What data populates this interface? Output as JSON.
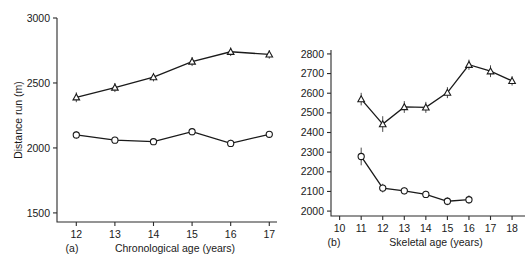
{
  "figure": {
    "panel_a_letter": "(a)",
    "panel_b_letter": "(b)",
    "footer_note": ""
  },
  "chart_data": [
    {
      "id": "panel-a",
      "type": "line",
      "title": "",
      "panel_label": "(a)",
      "xlabel": "Chronological age (years)",
      "ylabel": "Distance run (m)",
      "xlim": [
        11.5,
        17.2
      ],
      "ylim": [
        1430,
        3000
      ],
      "xticks": [
        12,
        13,
        14,
        15,
        16,
        17
      ],
      "yticks": [
        1500,
        2000,
        2500,
        3000
      ],
      "grid": false,
      "legend": "none",
      "x": [
        12,
        13,
        14,
        15,
        16,
        17
      ],
      "series": [
        {
          "name": "Upper series (triangles)",
          "marker": "triangle",
          "values": [
            2390,
            2465,
            2545,
            2665,
            2740,
            2720
          ],
          "errors": [
            38,
            35,
            33,
            35,
            33,
            33
          ]
        },
        {
          "name": "Lower series (circles)",
          "marker": "circle",
          "values": [
            2100,
            2060,
            2048,
            2125,
            2035,
            2105
          ],
          "errors": [
            30,
            25,
            22,
            28,
            28,
            25
          ]
        }
      ]
    },
    {
      "id": "panel-b",
      "type": "line",
      "title": "",
      "panel_label": "(b)",
      "xlabel": "Skeletal age (years)",
      "ylabel": "",
      "xlim": [
        9.6,
        18.6
      ],
      "ylim": [
        1975,
        2820
      ],
      "xticks": [
        10,
        11,
        12,
        13,
        14,
        15,
        16,
        17,
        18
      ],
      "yticks": [
        2000,
        2100,
        2200,
        2300,
        2400,
        2500,
        2600,
        2700,
        2800
      ],
      "grid": false,
      "legend": "none",
      "series": [
        {
          "name": "Upper series (triangles)",
          "marker": "triangle",
          "x": [
            11,
            12,
            13,
            14,
            15,
            16,
            17,
            18
          ],
          "values": [
            2570,
            2443,
            2530,
            2528,
            2603,
            2745,
            2712,
            2663
          ],
          "errors": [
            32,
            40,
            30,
            28,
            28,
            26,
            30,
            24
          ]
        },
        {
          "name": "Lower series (circles)",
          "marker": "circle",
          "x": [
            11,
            12,
            13,
            14,
            15,
            16
          ],
          "values": [
            2278,
            2117,
            2103,
            2085,
            2050,
            2058
          ],
          "errors": [
            45,
            22,
            18,
            18,
            20,
            22
          ]
        }
      ]
    }
  ]
}
